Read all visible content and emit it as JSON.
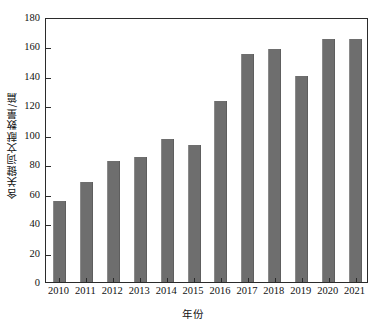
{
  "chart_data": {
    "type": "bar",
    "title": "",
    "xlabel": "年份",
    "ylabel": "含关键词文献数量/篇",
    "categories": [
      "2010",
      "2011",
      "2012",
      "2013",
      "2014",
      "2015",
      "2016",
      "2017",
      "2018",
      "2019",
      "2020",
      "2021"
    ],
    "values": [
      55,
      68,
      82,
      85,
      97,
      93,
      123,
      155,
      158,
      140,
      165,
      165
    ],
    "ylim": [
      0,
      180
    ],
    "ytick_step": 20,
    "yticks": [
      "0",
      "20",
      "40",
      "60",
      "80",
      "100",
      "120",
      "140",
      "160",
      "180"
    ],
    "grid": false,
    "legend": null,
    "bar_color": "#6e6e6e",
    "axis_color": "#2b2b2b",
    "background": "#ffffff"
  }
}
